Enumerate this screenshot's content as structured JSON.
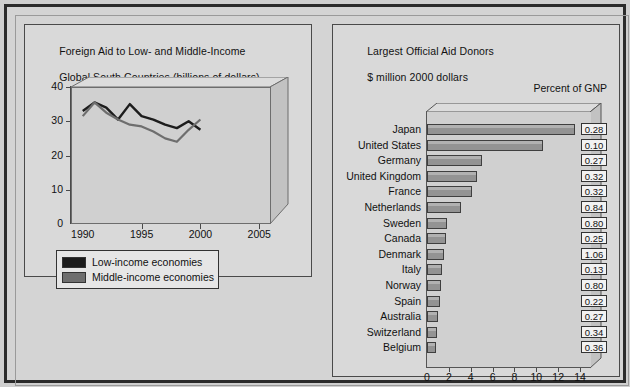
{
  "figure": {
    "background": "#d4d4d4",
    "frame_color": "#2b2b2b"
  },
  "left_panel": {
    "title_line1": "Foreign Aid to Low- and Middle-Income",
    "title_line2": "Global South Countries (billions of dollars)",
    "legend": [
      {
        "label": "Low-income economies",
        "color": "#1c1c1c"
      },
      {
        "label": "Middle-income economies",
        "color": "#6e6e6e"
      }
    ]
  },
  "right_panel": {
    "title_line1": "Largest Official Aid Donors",
    "title_line2": "$ million 2000 dollars",
    "gnp_header": "Percent of GNP"
  },
  "chart_data": [
    {
      "type": "line",
      "title": "Foreign Aid to Low- and Middle-Income Global South Countries (billions of dollars)",
      "xlabel": "",
      "ylabel": "billions of dollars",
      "xlim": [
        1989,
        2006
      ],
      "ylim": [
        0,
        40
      ],
      "yticks": [
        0,
        10,
        20,
        30,
        40
      ],
      "xticks": [
        1990,
        1995,
        2000,
        2005
      ],
      "grid": false,
      "legend_position": "below-left",
      "x": [
        1990,
        1991,
        1992,
        1993,
        1994,
        1995,
        1996,
        1997,
        1998,
        1999,
        2000
      ],
      "series": [
        {
          "name": "Low-income economies",
          "color": "#1c1c1c",
          "values": [
            33.0,
            35.5,
            34.0,
            30.5,
            35.0,
            31.5,
            30.5,
            29.0,
            28.0,
            30.0,
            27.5
          ]
        },
        {
          "name": "Middle-income economies",
          "color": "#6e6e6e",
          "values": [
            31.5,
            35.5,
            32.5,
            30.5,
            29.0,
            28.5,
            27.0,
            25.0,
            24.0,
            27.5,
            30.5
          ]
        }
      ]
    },
    {
      "type": "bar",
      "orientation": "horizontal",
      "title": "Largest Official Aid Donors",
      "subtitle": "$ million 2000 dollars",
      "xlabel": "",
      "ylabel": "",
      "xlim": [
        0,
        15
      ],
      "xticks": [
        0,
        2,
        4,
        6,
        8,
        10,
        12,
        14
      ],
      "grid": false,
      "bar_color": "#939393",
      "annotation_column_header": "Percent of GNP",
      "categories": [
        "Japan",
        "United States",
        "Germany",
        "United Kingdom",
        "France",
        "Netherlands",
        "Sweden",
        "Canada",
        "Denmark",
        "Italy",
        "Norway",
        "Spain",
        "Australia",
        "Switzerland",
        "Belgium"
      ],
      "values": [
        13.5,
        10.6,
        5.0,
        4.6,
        4.1,
        3.1,
        1.8,
        1.7,
        1.6,
        1.4,
        1.3,
        1.2,
        0.99,
        0.89,
        0.82
      ],
      "annotations": [
        "0.28",
        "0.10",
        "0.27",
        "0.32",
        "0.32",
        "0.84",
        "0.80",
        "0.25",
        "1.06",
        "0.13",
        "0.80",
        "0.22",
        "0.27",
        "0.34",
        "0.36"
      ]
    }
  ]
}
